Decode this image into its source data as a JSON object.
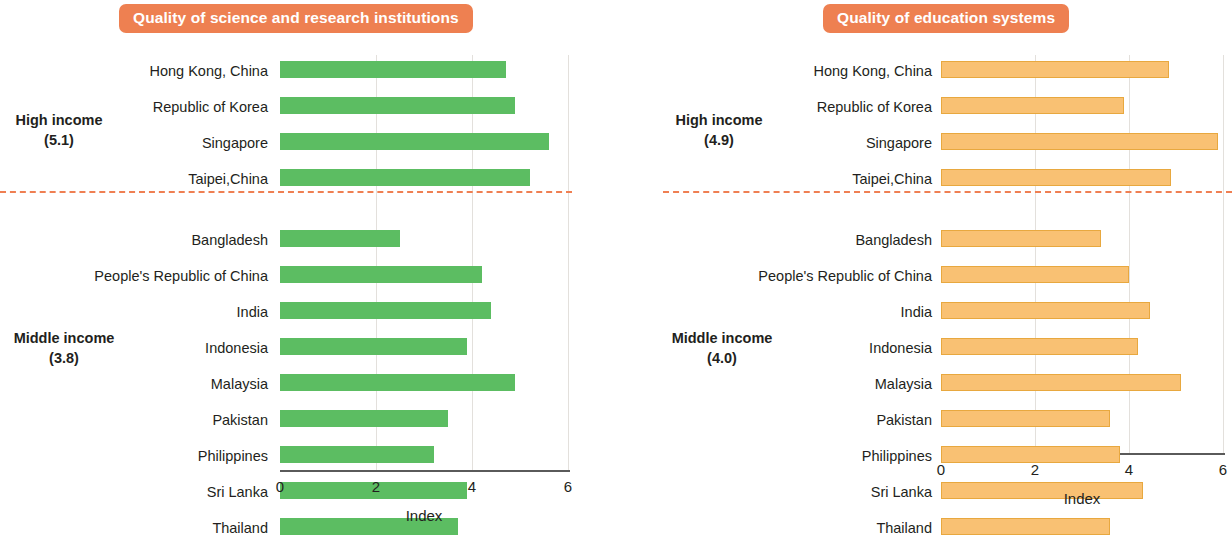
{
  "chart_data": [
    {
      "type": "bar",
      "orientation": "horizontal",
      "title": "Quality of science and research institutions",
      "xlabel": "Index",
      "ylabel": "",
      "xlim": [
        0,
        6
      ],
      "xticks": [
        0,
        2,
        4,
        6
      ],
      "xtick_labels": [
        "0",
        "2",
        "4",
        "6"
      ],
      "grid": true,
      "bar_color": "#5cbd62",
      "groups": [
        {
          "name": "High income",
          "average": "5.1",
          "label_line1": "High income",
          "label_line2": "(5.1)",
          "categories": [
            "Hong Kong, China",
            "Republic of Korea",
            "Singapore",
            "Taipei,China"
          ],
          "values": [
            4.7,
            4.9,
            5.6,
            5.2
          ]
        },
        {
          "name": "Middle income",
          "average": "3.8",
          "label_line1": "Middle income",
          "label_line2": "(3.8)",
          "categories": [
            "Bangladesh",
            "People's Republic of China",
            "India",
            "Indonesia",
            "Malaysia",
            "Pakistan",
            "Philippines",
            "Sri Lanka",
            "Thailand"
          ],
          "values": [
            2.5,
            4.2,
            4.4,
            3.9,
            4.9,
            3.5,
            3.2,
            3.9,
            3.7
          ]
        }
      ]
    },
    {
      "type": "bar",
      "orientation": "horizontal",
      "title": "Quality of education systems",
      "xlabel": "Index",
      "ylabel": "",
      "xlim": [
        0,
        6
      ],
      "xticks": [
        0,
        2,
        4,
        6
      ],
      "xtick_labels": [
        "0",
        "2",
        "4",
        "6"
      ],
      "grid": true,
      "bar_color": "#f9c173",
      "groups": [
        {
          "name": "High income",
          "average": "4.9",
          "label_line1": "High income",
          "label_line2": "(4.9)",
          "categories": [
            "Hong Kong, China",
            "Republic of Korea",
            "Singapore",
            "Taipei,China"
          ],
          "values": [
            4.85,
            3.9,
            5.9,
            4.9
          ]
        },
        {
          "name": "Middle income",
          "average": "4.0",
          "label_line1": "Middle income",
          "label_line2": "(4.0)",
          "categories": [
            "Bangladesh",
            "People's Republic of China",
            "India",
            "Indonesia",
            "Malaysia",
            "Pakistan",
            "Philippines",
            "Sri Lanka",
            "Thailand"
          ],
          "values": [
            3.4,
            4.0,
            4.45,
            4.2,
            5.1,
            3.6,
            3.8,
            4.3,
            3.6
          ]
        }
      ]
    }
  ],
  "panels": {
    "left": {
      "badge_label": "Quality of science and research institutions",
      "high_income_label": "High income",
      "high_income_value": "(5.1)",
      "middle_income_label": "Middle income",
      "middle_income_value": "(3.8)",
      "axis_title": "Index"
    },
    "right": {
      "badge_label": "Quality of education systems",
      "high_income_label": "High income",
      "high_income_value": "(4.9)",
      "middle_income_label": "Middle income",
      "middle_income_value": "(4.0)",
      "axis_title": "Index"
    }
  },
  "colors": {
    "badge": "#ee8051",
    "green_bar": "#5cbd62",
    "orange_bar": "#f9c173",
    "divider": "#ef7f52",
    "grid": "#e3e0dc",
    "axis": "#5a5a5a"
  }
}
